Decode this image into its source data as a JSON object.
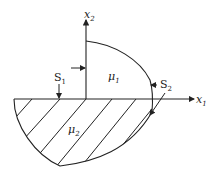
{
  "diagram": {
    "axes": {
      "x1_label": "x",
      "x1_sub": "1",
      "x2_label": "x",
      "x2_sub": "2"
    },
    "regions": [
      {
        "name": "upper",
        "label": "μ",
        "sub": "1",
        "hatched": false
      },
      {
        "name": "lower",
        "label": "μ",
        "sub": "2",
        "hatched": true
      }
    ],
    "surfaces": [
      {
        "label": "S",
        "sub": "1"
      },
      {
        "label": "S",
        "sub": "2"
      }
    ],
    "colors": {
      "stroke": "#222222",
      "background": "#ffffff"
    }
  }
}
